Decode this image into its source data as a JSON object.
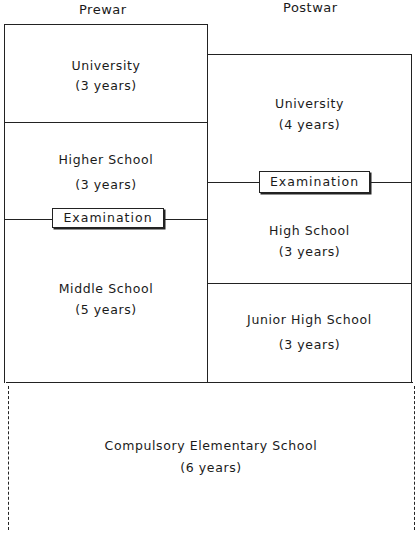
{
  "headers": {
    "prewar": "Prewar",
    "postwar": "Postwar"
  },
  "prewar": {
    "university": {
      "name": "University",
      "duration": "(3 years)"
    },
    "higher_school": {
      "name": "Higher School",
      "duration": "(3 years)"
    },
    "examination": "Examination",
    "middle_school": {
      "name": "Middle School",
      "duration": "(5 years)"
    }
  },
  "postwar": {
    "university": {
      "name": "University",
      "duration": "(4 years)"
    },
    "examination": "Examination",
    "high_school": {
      "name": "High School",
      "duration": "(3 years)"
    },
    "junior_high": {
      "name": "Junior High School",
      "duration": "(3 years)"
    }
  },
  "shared": {
    "elementary": {
      "name": "Compulsory Elementary School",
      "duration": "(6 years)"
    }
  }
}
